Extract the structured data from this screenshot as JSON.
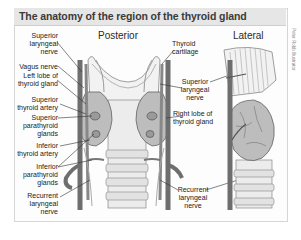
{
  "title": "The anatomy of the region of the thyroid gland",
  "panels": {
    "posterior": {
      "title": "Posterior",
      "labels_left": [
        {
          "text": "Superior\nlaryngeal\nnerve"
        },
        {
          "text": "Vagus nerve"
        },
        {
          "text": "Left lobe of\nthyroid gland"
        },
        {
          "text": "Superior\nthyroid artery"
        },
        {
          "text": "Superior\nparathyroid\nglands"
        },
        {
          "text": "Inferior\nthyroid artery"
        },
        {
          "text": "Inferior\nparathyroid\nglands"
        },
        {
          "text": "Recurrent\nlaryngeal\nnerve"
        }
      ],
      "labels_right": [
        {
          "text": "Thyroid\ncartilage"
        },
        {
          "text": "Superior\nlaryngeal\nnerve"
        },
        {
          "text": "Right lobe of\nthyroid gland"
        },
        {
          "text": "Recurrent\nlaryngeal\nnerve"
        }
      ]
    },
    "lateral": {
      "title": "Lateral"
    }
  },
  "credit": "Peter Robb Illustrator",
  "colors": {
    "title_bar": "#e6e6e6",
    "title_text": "#3a3a3a",
    "vessel": "#6e6e6e",
    "gland": "#b8b8b8",
    "cartilage": "#efefef",
    "outline": "#555555"
  }
}
